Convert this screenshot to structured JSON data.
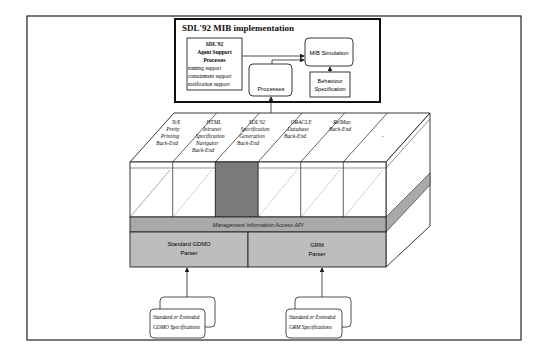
{
  "figure": {
    "title": "SDL'92 MIB implementation",
    "colors": {
      "line": "#222222",
      "band_gray": "#a9a9a9",
      "parser_gray": "#bdbdbd",
      "highlight_column": "#7a7a7a",
      "background": "#ffffff"
    }
  },
  "mib_box": {
    "title": "SDL'92 MIB implementation",
    "agent_support": {
      "line1": "SDL'92",
      "line2": "Agent Support",
      "line3": "Processes",
      "items": [
        "naming support",
        "containment support",
        "notification support"
      ]
    },
    "processes_label": "Processes",
    "mib_simulation_label": "MIB Simulation",
    "behaviour_spec": {
      "line1": "Behaviour",
      "line2": "Specification"
    }
  },
  "backends": [
    {
      "lines": [
        "TeX",
        "Pretty",
        "Printing",
        "Back-End"
      ]
    },
    {
      "lines": [
        "HTML",
        "Intranet",
        "Specification",
        "Navigator",
        "Back-End"
      ]
    },
    {
      "lines": [
        "SDL'92",
        "Specification",
        "Generation",
        "Back-End"
      ]
    },
    {
      "lines": [
        "ORACLE",
        "Database",
        "Back-End"
      ]
    },
    {
      "lines": [
        "RelMan",
        "Back-End"
      ]
    },
    {
      "lines": [
        "-"
      ]
    }
  ],
  "api_band": {
    "label": "Management Information Access API"
  },
  "parsers": {
    "gdmo": {
      "line1": "Standard GDMO",
      "line2": "Parser"
    },
    "grm": {
      "line1": "GRM",
      "line2": "Parser"
    }
  },
  "inputs": {
    "gdmo": {
      "line1": "Standard or Extended",
      "line2": "GDMO Specifications"
    },
    "grm": {
      "line1": "Standard or Extended",
      "line2": "GRM Specifications"
    }
  }
}
